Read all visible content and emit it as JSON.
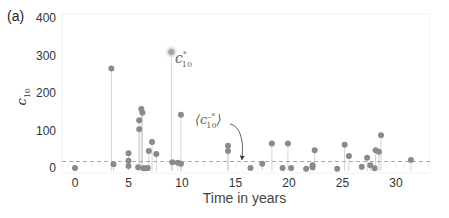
{
  "figure": {
    "panel_label": "(a)",
    "colors": {
      "point": "#8a8a8a",
      "stem": "#d4d4d4",
      "mean_line": "#a8a8a8",
      "highlight_glow": "#c8c8c8",
      "frame": "#f0f0f0",
      "text": "#333333"
    }
  },
  "chart_data": {
    "type": "scatter",
    "subtype": "stem",
    "title": "",
    "xlabel": "Time in years",
    "ylabel": "c10",
    "xlim": [
      -1.2,
      33.3
    ],
    "ylim": [
      0,
      400
    ],
    "xticks": [
      0,
      5,
      10,
      15,
      20,
      25,
      30
    ],
    "yticks": [
      0,
      100,
      200,
      300,
      400
    ],
    "grid": false,
    "legend": null,
    "mean_line": {
      "y": 20,
      "style": "dashed",
      "label": "⟨c̄*10⟩"
    },
    "highlight": {
      "x": 9.0,
      "y": 312,
      "label": "c*10"
    },
    "points": [
      {
        "x": 0.0,
        "y": 3
      },
      {
        "x": 3.4,
        "y": 268
      },
      {
        "x": 3.6,
        "y": 13
      },
      {
        "x": 5.0,
        "y": 42
      },
      {
        "x": 5.0,
        "y": 22
      },
      {
        "x": 5.0,
        "y": 8
      },
      {
        "x": 5.9,
        "y": 5
      },
      {
        "x": 6.0,
        "y": 130
      },
      {
        "x": 6.0,
        "y": 106
      },
      {
        "x": 6.2,
        "y": 160
      },
      {
        "x": 6.3,
        "y": 150
      },
      {
        "x": 6.4,
        "y": 2
      },
      {
        "x": 6.6,
        "y": 2
      },
      {
        "x": 6.8,
        "y": 3
      },
      {
        "x": 6.9,
        "y": 48
      },
      {
        "x": 7.2,
        "y": 72
      },
      {
        "x": 7.6,
        "y": 40
      },
      {
        "x": 9.0,
        "y": 312
      },
      {
        "x": 9.1,
        "y": 18
      },
      {
        "x": 9.6,
        "y": 17
      },
      {
        "x": 9.9,
        "y": 14
      },
      {
        "x": 9.9,
        "y": 145
      },
      {
        "x": 14.3,
        "y": 62
      },
      {
        "x": 14.3,
        "y": 48
      },
      {
        "x": 16.4,
        "y": 3
      },
      {
        "x": 17.5,
        "y": 14
      },
      {
        "x": 18.4,
        "y": 68
      },
      {
        "x": 19.4,
        "y": 3
      },
      {
        "x": 19.9,
        "y": 68
      },
      {
        "x": 20.2,
        "y": 3
      },
      {
        "x": 21.6,
        "y": 1
      },
      {
        "x": 22.2,
        "y": 5
      },
      {
        "x": 22.2,
        "y": 10
      },
      {
        "x": 22.4,
        "y": 50
      },
      {
        "x": 24.5,
        "y": 1
      },
      {
        "x": 25.2,
        "y": 65
      },
      {
        "x": 25.6,
        "y": 35
      },
      {
        "x": 26.8,
        "y": 6
      },
      {
        "x": 27.3,
        "y": 30
      },
      {
        "x": 27.6,
        "y": 10
      },
      {
        "x": 28.0,
        "y": 2
      },
      {
        "x": 28.1,
        "y": 50
      },
      {
        "x": 28.4,
        "y": 46
      },
      {
        "x": 28.6,
        "y": 90
      },
      {
        "x": 31.4,
        "y": 24
      }
    ]
  }
}
